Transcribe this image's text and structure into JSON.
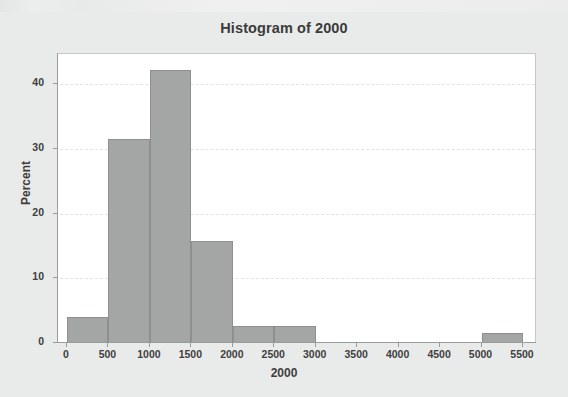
{
  "page": {
    "background_color": "#e9eaea"
  },
  "chart_data": {
    "type": "bar",
    "chart_kind": "histogram",
    "title": "Histogram of 2000",
    "xlabel": "2000",
    "ylabel": "Percent",
    "xlim": [
      -250,
      5750
    ],
    "ylim": [
      0,
      45
    ],
    "grid": true,
    "grid_style": "dashed-horizontal",
    "legend": "none",
    "bin_width": 500,
    "x_ticks": [
      0,
      500,
      1000,
      1500,
      2000,
      2500,
      3000,
      3500,
      4000,
      4500,
      5000,
      5500
    ],
    "x_tick_labels": [
      "0",
      "500",
      "1000",
      "1500",
      "2000",
      "2500",
      "3000",
      "3500",
      "4000",
      "4500",
      "5000",
      "5500"
    ],
    "y_ticks": [
      0,
      10,
      20,
      30,
      40
    ],
    "y_tick_labels": [
      "0",
      "10",
      "20",
      "30",
      "40"
    ],
    "bars": [
      {
        "bin_start": 0,
        "bin_end": 500,
        "value": 4.0
      },
      {
        "bin_start": 500,
        "bin_end": 1000,
        "value": 31.5
      },
      {
        "bin_start": 1000,
        "bin_end": 1500,
        "value": 42.2
      },
      {
        "bin_start": 1500,
        "bin_end": 2000,
        "value": 15.8
      },
      {
        "bin_start": 2000,
        "bin_end": 2500,
        "value": 2.6
      },
      {
        "bin_start": 2500,
        "bin_end": 3000,
        "value": 2.6
      },
      {
        "bin_start": 5000,
        "bin_end": 5500,
        "value": 1.5
      }
    ],
    "categories": [
      "0-500",
      "500-1000",
      "1000-1500",
      "1500-2000",
      "2000-2500",
      "2500-3000",
      "3000-3500",
      "3500-4000",
      "4000-4500",
      "4500-5000",
      "5000-5500"
    ],
    "values": [
      4.0,
      31.5,
      42.2,
      15.8,
      2.6,
      2.6,
      0,
      0,
      0,
      0,
      1.5
    ],
    "colors": {
      "bar_fill": "#a4a5a5",
      "bar_border": "#8e8f8f",
      "plot_background": "#ffffff",
      "frame_border": "#c6c8c8",
      "axis": "#9a9c9c",
      "text": "#3d3d3d",
      "gridline": "#e2e3e3"
    }
  }
}
